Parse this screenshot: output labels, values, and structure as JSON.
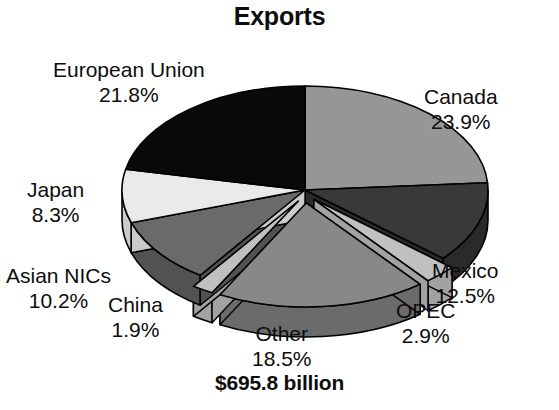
{
  "chart_data": {
    "type": "pie",
    "title": "Exports",
    "total_label": "$695.8 billion",
    "units": "percent of total exports",
    "legend": "none",
    "labels_inline": true,
    "three_d": true,
    "start_angle_deg": 0,
    "direction": "clockwise",
    "categories": [
      "Canada",
      "Mexico",
      "OPEC",
      "Other",
      "China",
      "Asian NICs",
      "Japan",
      "European Union"
    ],
    "values": [
      23.9,
      12.5,
      2.9,
      18.5,
      1.9,
      10.2,
      8.3,
      21.8
    ],
    "slices": [
      {
        "name": "Canada",
        "percent": 23.9,
        "percent_label": "23.9%",
        "color": "#9c9c9c",
        "side_color": "#7d7d7d",
        "exploded": false
      },
      {
        "name": "Mexico",
        "percent": 12.5,
        "percent_label": "12.5%",
        "color": "#3b3b3b",
        "side_color": "#2b2b2b",
        "exploded": false
      },
      {
        "name": "OPEC",
        "percent": 2.9,
        "percent_label": "2.9%",
        "color": "#c7c7c7",
        "side_color": "#a8a8a8",
        "exploded": true
      },
      {
        "name": "Other",
        "percent": 18.5,
        "percent_label": "18.5%",
        "color": "#8d8d8d",
        "side_color": "#6f6f6f",
        "exploded": true
      },
      {
        "name": "China",
        "percent": 1.9,
        "percent_label": "1.9%",
        "color": "#c7c7c7",
        "side_color": "#a8a8a8",
        "exploded": true
      },
      {
        "name": "Asian NICs",
        "percent": 10.2,
        "percent_label": "10.2%",
        "color": "#6e6e6e",
        "side_color": "#555555",
        "exploded": false
      },
      {
        "name": "Japan",
        "percent": 8.3,
        "percent_label": "8.3%",
        "color": "#f2f2f2",
        "side_color": "#d2d2d2",
        "exploded": false
      },
      {
        "name": "European Union",
        "percent": 21.8,
        "percent_label": "21.8%",
        "color": "#0a0a0a",
        "side_color": "#050505",
        "exploded": false
      }
    ]
  },
  "labels": {
    "european_union": {
      "name": "European Union",
      "pct": "21.8%"
    },
    "canada": {
      "name": "Canada",
      "pct": "23.9%"
    },
    "mexico": {
      "name": "Mexico",
      "pct": "12.5%"
    },
    "opec": {
      "name": "OPEC",
      "pct": "2.9%"
    },
    "other": {
      "name": "Other",
      "pct": "18.5%"
    },
    "china": {
      "name": "China",
      "pct": "1.9%"
    },
    "asian_nics": {
      "name": "Asian NICs",
      "pct": "10.2%"
    },
    "japan": {
      "name": "Japan",
      "pct": "8.3%"
    }
  },
  "colors": {
    "background": "#ffffff",
    "text": "#0d0d0d",
    "outline": "#000000"
  }
}
